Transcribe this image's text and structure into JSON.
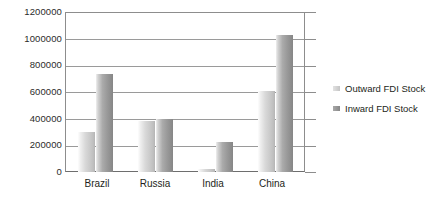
{
  "chart_data": {
    "type": "bar",
    "title": "",
    "subtitle": "",
    "xlabel": "",
    "ylabel": "",
    "categories": [
      "Brazil",
      "Russia",
      "India",
      "China"
    ],
    "series": [
      {
        "name": "Outward FDI Stock",
        "color": "#cfcfcf",
        "values": [
          300000,
          380000,
          25000,
          607000
        ]
      },
      {
        "name": "Inward FDI Stock",
        "color": "#959595",
        "values": [
          735000,
          398000,
          225000,
          1027000
        ]
      }
    ],
    "ylim": [
      0,
      1200000
    ],
    "ytick_values": [
      0,
      200000,
      400000,
      600000,
      800000,
      1000000,
      1200000
    ],
    "ytick_labels": [
      "0",
      "200000",
      "400000",
      "600000",
      "800000",
      "1000000",
      "1200000"
    ],
    "grid": true,
    "grid_axis": "y",
    "legend_position": "right",
    "legend": [
      "Outward FDI Stock",
      "Inward FDI Stock"
    ]
  },
  "axes": {
    "y": {
      "ticks": [
        {
          "label": "1200000",
          "value": 1200000
        },
        {
          "label": "1000000",
          "value": 1000000
        },
        {
          "label": "800000",
          "value": 800000
        },
        {
          "label": "600000",
          "value": 600000
        },
        {
          "label": "400000",
          "value": 400000
        },
        {
          "label": "200000",
          "value": 200000
        },
        {
          "label": "0",
          "value": 0
        }
      ]
    },
    "x": {
      "ticks": [
        {
          "label": "Brazil"
        },
        {
          "label": "Russia"
        },
        {
          "label": "India"
        },
        {
          "label": "China"
        }
      ]
    }
  },
  "legend": {
    "items": [
      {
        "label": "Outward FDI Stock",
        "swatch": "outward"
      },
      {
        "label": "Inward FDI Stock",
        "swatch": "inward"
      }
    ]
  }
}
